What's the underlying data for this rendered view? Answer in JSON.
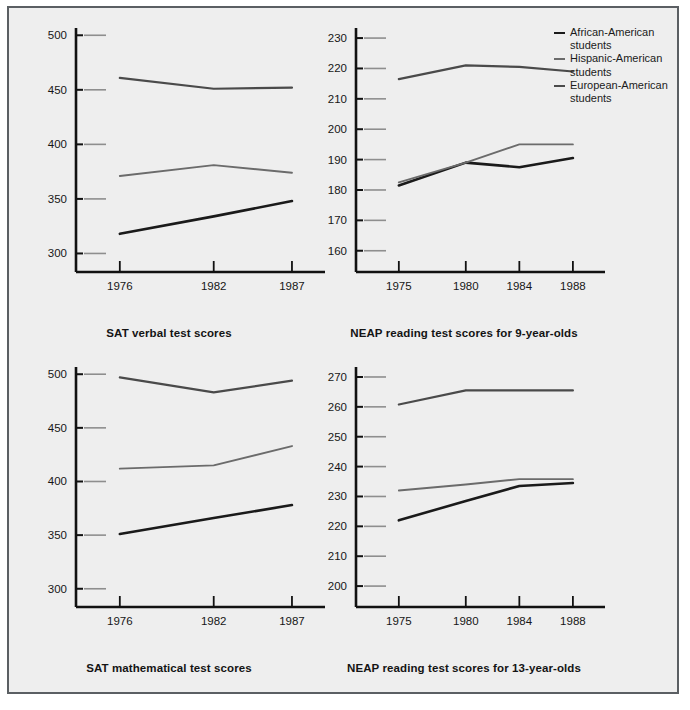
{
  "legend": {
    "position": "top-right",
    "items": [
      {
        "label": "African-American students",
        "color": "#1a1a1a"
      },
      {
        "label": "Hispanic-American students",
        "color": "#6b6b6b"
      },
      {
        "label": "European-American students",
        "color": "#4a4a4a"
      }
    ]
  },
  "colors": {
    "african_american": "#1a1a1a",
    "hispanic_american": "#6b6b6b",
    "european_american": "#4a4a4a",
    "axis": "#111111",
    "grid_stub": "#8e8e8e",
    "page_background": "#eeeeee",
    "frame_border": "#5b5f63"
  },
  "chart_data": [
    {
      "id": "sat-verbal",
      "type": "line",
      "title": "SAT verbal test scores",
      "xlabel": "",
      "ylabel": "",
      "x": [
        1976,
        1982,
        1987
      ],
      "xticklabels": [
        "1976",
        "1982",
        "1987"
      ],
      "xlim": [
        1973.2,
        1988.6
      ],
      "ylim": [
        283,
        503
      ],
      "yticks": [
        300,
        350,
        400,
        450,
        500
      ],
      "yticklabels": [
        "300",
        "350",
        "400",
        "450",
        "500"
      ],
      "grid": false,
      "series": [
        {
          "name": "African-American students",
          "values": [
            318,
            334,
            348
          ]
        },
        {
          "name": "Hispanic-American students",
          "values": [
            371,
            381,
            374
          ]
        },
        {
          "name": "European-American students",
          "values": [
            461,
            451,
            452
          ]
        }
      ]
    },
    {
      "id": "neap-reading-9",
      "type": "line",
      "title": "NEAP reading test scores for 9-year-olds",
      "xlabel": "",
      "ylabel": "",
      "x": [
        1975,
        1980,
        1984,
        1988
      ],
      "xticklabels": [
        "1975",
        "1980",
        "1984",
        "1988"
      ],
      "xlim": [
        1971.8,
        1989.8
      ],
      "ylim": [
        153,
        232
      ],
      "yticks": [
        160,
        170,
        180,
        190,
        200,
        210,
        220,
        230
      ],
      "yticklabels": [
        "160",
        "170",
        "180",
        "190",
        "200",
        "210",
        "220",
        "230"
      ],
      "grid": false,
      "series": [
        {
          "name": "African-American students",
          "values": [
            181.5,
            189,
            187.5,
            190.5
          ]
        },
        {
          "name": "Hispanic-American students",
          "values": [
            182.5,
            189,
            195,
            195
          ]
        },
        {
          "name": "European-American students",
          "values": [
            216.5,
            221,
            220.5,
            219
          ]
        }
      ]
    },
    {
      "id": "sat-mathematical",
      "type": "line",
      "title": "SAT mathematical test scores",
      "xlabel": "",
      "ylabel": "",
      "x": [
        1976,
        1982,
        1987
      ],
      "xticklabels": [
        "1976",
        "1982",
        "1987"
      ],
      "xlim": [
        1973.2,
        1988.6
      ],
      "ylim": [
        283,
        503
      ],
      "yticks": [
        300,
        350,
        400,
        450,
        500
      ],
      "yticklabels": [
        "300",
        "350",
        "400",
        "450",
        "500"
      ],
      "grid": false,
      "series": [
        {
          "name": "African-American students",
          "values": [
            351,
            366,
            378
          ]
        },
        {
          "name": "Hispanic-American students",
          "values": [
            412,
            415,
            433
          ]
        },
        {
          "name": "European-American students",
          "values": [
            497,
            483,
            494
          ]
        }
      ]
    },
    {
      "id": "neap-reading-13",
      "type": "line",
      "title": "NEAP reading test scores for 13-year-olds",
      "xlabel": "",
      "ylabel": "",
      "x": [
        1975,
        1980,
        1984,
        1988
      ],
      "xticklabels": [
        "1975",
        "1980",
        "1984",
        "1988"
      ],
      "xlim": [
        1971.8,
        1989.8
      ],
      "ylim": [
        193,
        272
      ],
      "yticks": [
        200,
        210,
        220,
        230,
        240,
        250,
        260,
        270
      ],
      "yticklabels": [
        "200",
        "210",
        "220",
        "230",
        "240",
        "250",
        "260",
        "270"
      ],
      "grid": false,
      "series": [
        {
          "name": "African-American students",
          "values": [
            222,
            228.5,
            233.5,
            234.5
          ]
        },
        {
          "name": "Hispanic-American students",
          "values": [
            232,
            234,
            235.8,
            235.8
          ]
        },
        {
          "name": "European-American students",
          "values": [
            260.8,
            265.5,
            265.5,
            265.5
          ]
        }
      ]
    }
  ]
}
